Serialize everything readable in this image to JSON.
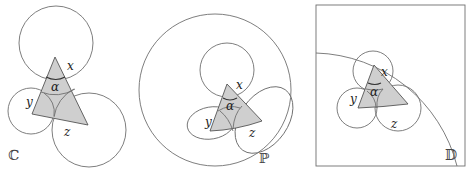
{
  "panels": [
    {
      "id": "C",
      "model_label": "ℂ",
      "labels": {
        "x": "x",
        "y": "y",
        "z": "z",
        "alpha": "α"
      }
    },
    {
      "id": "P",
      "model_label": "ℙ",
      "labels": {
        "x": "x",
        "y": "y",
        "z": "z",
        "alpha": "α"
      }
    },
    {
      "id": "D",
      "model_label": "𝔻",
      "labels": {
        "x": "x",
        "y": "y",
        "z": "z",
        "alpha": "α"
      }
    }
  ],
  "colors": {
    "triangle_fill": "#cfcfcf",
    "circle_stroke": "#6f6f6f",
    "text": "#222222"
  }
}
